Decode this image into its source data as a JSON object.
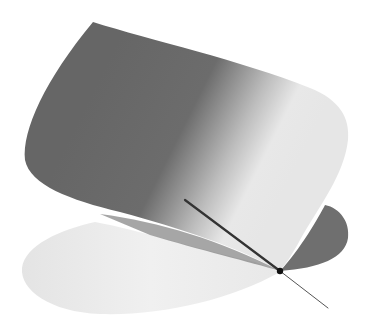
{
  "figure": {
    "background": "#ffffff",
    "colors": {
      "surface_dark": "#666666",
      "surface_mid": "#8a8a8a",
      "surface_light": "#e6e6e6",
      "lower_light": "#eeeeee",
      "lower_dark": "#6e6e6e",
      "line": "#333333",
      "point": "#111111"
    },
    "upper_surface": {
      "label": ""
    },
    "lower_surface": {
      "label": ""
    },
    "line": {
      "start": [
        185,
        200
      ],
      "point": [
        280,
        271
      ],
      "end": [
        328,
        308
      ]
    }
  }
}
